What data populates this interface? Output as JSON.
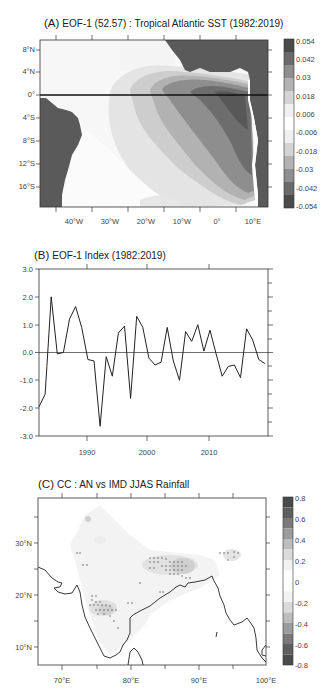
{
  "chart_data": [
    {
      "type": "heatmap",
      "panel": "A",
      "title": "(A) EOF-1 (52.57) : Tropical Atlantic SST (1982:2019)",
      "panel_letter": "(A)",
      "title_rest": "EOF-1 (52.57) : Tropical Atlantic SST (1982:2019)",
      "xlabel": "",
      "ylabel": "",
      "x_ticks": [
        "40°W",
        "30°W",
        "20°W",
        "10°W",
        "0°",
        "10°E"
      ],
      "y_ticks": [
        "8°N",
        "4°N",
        "0°",
        "4°S",
        "8°S",
        "12°S",
        "16°S"
      ],
      "xlim": [
        -48,
        13
      ],
      "ylim": [
        -19,
        10
      ],
      "colorbar_labels": [
        "0.054",
        "0.042",
        "0.03",
        "0.018",
        "0.006",
        "-0.006",
        "-0.018",
        "-0.03",
        "-0.042",
        "-0.054"
      ],
      "description": "Positive loading maximum (>0.042) in eastern equatorial Atlantic / Gulf of Guinea extending southeast along African coast to ~16°S; values decrease westward; land masked dark grey"
    },
    {
      "type": "line",
      "panel": "B",
      "title": "(B) EOF-1 Index (1982:2019)",
      "panel_letter": "(B)",
      "title_rest": "EOF-1 Index (1982:2019)",
      "xlabel": "",
      "ylabel": "",
      "ylim": [
        -3.0,
        3.0
      ],
      "xlim": [
        1982,
        2019.5
      ],
      "y_ticks": [
        "3.0",
        "2.0",
        "1.0",
        "0.0",
        "-1.0",
        "-2.0",
        "-3.0"
      ],
      "x_ticks": [
        "1990",
        "2000",
        "2010"
      ],
      "x": [
        1982,
        1983,
        1983.3,
        1984,
        1985,
        1986,
        1987,
        1988,
        1989,
        1990,
        1991,
        1992,
        1993,
        1994,
        1995,
        1996,
        1997,
        1998,
        1999,
        2000,
        2001,
        2002,
        2003,
        2004,
        2005,
        2006,
        2007,
        2008,
        2009,
        2010,
        2011,
        2012,
        2013,
        2014,
        2015,
        2016,
        2017,
        2018,
        2019
      ],
      "series": [
        {
          "name": "EOF-1 Index",
          "values": [
            -1.95,
            -1.5,
            -0.5,
            2.0,
            -0.05,
            0.0,
            1.2,
            1.65,
            0.9,
            -0.25,
            -0.3,
            -2.65,
            -0.15,
            -0.85,
            0.7,
            0.95,
            -1.65,
            1.3,
            0.9,
            -0.2,
            -0.45,
            -0.35,
            0.9,
            -0.3,
            -1.0,
            0.75,
            0.4,
            1.0,
            0.05,
            0.8,
            -0.05,
            -0.85,
            -0.5,
            -0.45,
            -0.9,
            0.85,
            0.45,
            -0.25,
            -0.4
          ]
        }
      ],
      "zero_line": true
    },
    {
      "type": "heatmap",
      "panel": "C",
      "title": "(C) CC : AN vs IMD JJAS Rainfall",
      "panel_letter": "(C)",
      "title_rest": "CC : AN vs IMD JJAS Rainfall",
      "xlabel": "",
      "ylabel": "",
      "x_ticks": [
        "70°E",
        "80°E",
        "90°E",
        "100°E"
      ],
      "y_ticks": [
        "30°N",
        "20°N",
        "10°N"
      ],
      "xlim": [
        66.5,
        100
      ],
      "ylim": [
        6.5,
        38.5
      ],
      "colorbar_labels": [
        "0.8",
        "0.6",
        "0.4",
        "0.2",
        "0",
        "-0.2",
        "-0.4",
        "-0.6",
        "-0.8"
      ],
      "description": "Correlation over India; stippled significant negative/positive patches over Indo-Gangetic plain (~83-89°E, 23-27°N), western peninsula (~75-78°E, 16-20°N), and northeast (~94-96°E, 27°N)"
    }
  ]
}
